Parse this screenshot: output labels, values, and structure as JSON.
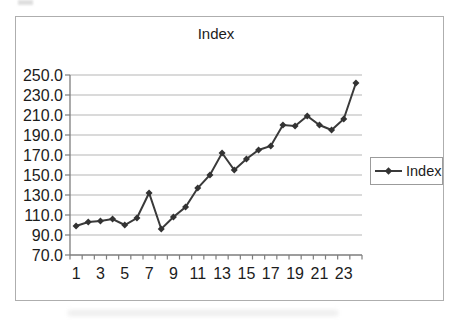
{
  "page": {
    "background": "#ffffff"
  },
  "chart_style": {
    "chart_border_color": "#aeaeae",
    "chart_background": "#ffffff",
    "gridline_color": "#b5b5b5",
    "axis_color": "#7d7d7d",
    "line_color": "#3a3a3a",
    "marker_color": "#333333",
    "text_color": "#1c1c1c",
    "legend_border_color": "#9b9b9b"
  },
  "chart_data": {
    "type": "line",
    "title": "Index",
    "categories": [
      1,
      2,
      3,
      4,
      5,
      6,
      7,
      8,
      9,
      10,
      11,
      12,
      13,
      14,
      15,
      16,
      17,
      18,
      19,
      20,
      21,
      22,
      23,
      24
    ],
    "x_tick_labels": [
      "1",
      "3",
      "5",
      "7",
      "9",
      "11",
      "13",
      "15",
      "17",
      "19",
      "21",
      "23"
    ],
    "series": [
      {
        "name": "Index",
        "marker": "diamond",
        "values": [
          99,
          103,
          104,
          106,
          100,
          107,
          132,
          96,
          108,
          118,
          137,
          150,
          172,
          155,
          166,
          175,
          179,
          200,
          199,
          209,
          200,
          195,
          206,
          242
        ]
      }
    ],
    "ylim": [
      70,
      250
    ],
    "y_tick_step": 20,
    "y_tick_labels": [
      "70.0",
      "90.0",
      "110.0",
      "130.0",
      "150.0",
      "170.0",
      "190.0",
      "210.0",
      "230.0",
      "250.0"
    ],
    "grid": "horizontal",
    "legend_position": "right",
    "legend_label": "Index"
  }
}
